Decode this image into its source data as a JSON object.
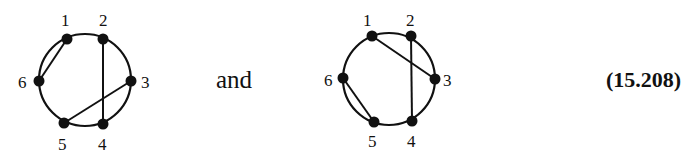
{
  "connector_text": "and",
  "equation_number": "(15.208)",
  "diagrams": [
    {
      "name": "chord-diagram-1",
      "circle": {
        "cx": 85,
        "cy": 80,
        "r": 46
      },
      "nodes": [
        {
          "id": "1",
          "x": 67,
          "y": 39,
          "lx": 61,
          "ly": 26
        },
        {
          "id": "2",
          "x": 103,
          "y": 39,
          "lx": 99,
          "ly": 26
        },
        {
          "id": "3",
          "x": 131,
          "y": 81,
          "lx": 141,
          "ly": 88
        },
        {
          "id": "4",
          "x": 103,
          "y": 124,
          "lx": 98,
          "ly": 150
        },
        {
          "id": "5",
          "x": 64,
          "y": 123,
          "lx": 58,
          "ly": 150
        },
        {
          "id": "6",
          "x": 39,
          "y": 81,
          "lx": 18,
          "ly": 88
        }
      ],
      "chords": [
        [
          "1",
          "6"
        ],
        [
          "2",
          "4"
        ],
        [
          "3",
          "5"
        ]
      ]
    },
    {
      "name": "chord-diagram-2",
      "circle": {
        "cx": 389,
        "cy": 79,
        "r": 46
      },
      "nodes": [
        {
          "id": "1",
          "x": 372,
          "y": 36,
          "lx": 363,
          "ly": 26
        },
        {
          "id": "2",
          "x": 411,
          "y": 36,
          "lx": 406,
          "ly": 26
        },
        {
          "id": "3",
          "x": 435,
          "y": 79,
          "lx": 443,
          "ly": 86
        },
        {
          "id": "4",
          "x": 412,
          "y": 121,
          "lx": 407,
          "ly": 147
        },
        {
          "id": "5",
          "x": 374,
          "y": 122,
          "lx": 368,
          "ly": 147
        },
        {
          "id": "6",
          "x": 343,
          "y": 78,
          "lx": 324,
          "ly": 86
        }
      ],
      "chords": [
        [
          "1",
          "3"
        ],
        [
          "2",
          "4"
        ],
        [
          "5",
          "6"
        ]
      ]
    }
  ]
}
